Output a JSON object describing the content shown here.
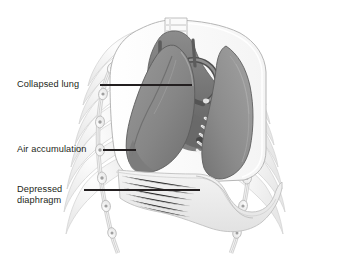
{
  "illustration": {
    "title": "Tension pneumothorax thoracic cavity illustration",
    "style": "grayscale medical line and wash drawing",
    "background_color": "#ffffff",
    "ink_color": "#231f20"
  },
  "labels": [
    {
      "id": "collapsed-lung",
      "text": "Collapsed lung",
      "lines": [
        "Collapsed lung"
      ],
      "text_x": 17,
      "text_y": 79,
      "leader": {
        "x1": 100,
        "y1": 85,
        "x2": 192,
        "y2": 85
      }
    },
    {
      "id": "air-accumulation",
      "text": "Air accumulation",
      "lines": [
        "Air accumulation"
      ],
      "text_x": 17,
      "text_y": 144,
      "leader": {
        "x1": 103,
        "y1": 150,
        "x2": 136,
        "y2": 150
      }
    },
    {
      "id": "depressed-diaphragm",
      "text": "Depressed\ndiaphragm",
      "lines": [
        "Depressed",
        "diaphragm"
      ],
      "text_x": 17,
      "text_y": 184,
      "leader": {
        "x1": 84,
        "y1": 190,
        "x2": 200,
        "y2": 190
      }
    }
  ],
  "anatomy": {
    "parts": [
      {
        "name": "trachea",
        "description": "banded cartilage tube at top center",
        "color": "#f2f2f2"
      },
      {
        "name": "collapsed-left-lung",
        "description": "shrunken dark gray lung on viewer left",
        "color": "#8a8a8a"
      },
      {
        "name": "right-lung",
        "description": "normal lung on viewer right with rib impressions",
        "color": "#8f8f8f"
      },
      {
        "name": "pleural-air-space",
        "description": "clear space between chest wall and collapsed lung",
        "color": "#fbfbfb"
      },
      {
        "name": "depressed-diaphragm",
        "description": "flattened downward-bulging diaphragm sheet",
        "color": "#ececec"
      },
      {
        "name": "mediastinum-heart",
        "description": "central heart and great vessels",
        "color": "#6f6f6f"
      },
      {
        "name": "rib-cage",
        "description": "pale outlined ribs in cross section on both sides",
        "color": "#e8e8e8"
      }
    ]
  },
  "palette": {
    "lung_dark": "#7e7e7e",
    "lung_mid": "#949494",
    "lung_light": "#ababab",
    "mediastinum": "#6c6c6c",
    "diaphragm": "#ededed",
    "rib_fill": "#f0f0f0",
    "rib_stroke": "#c9c9c9",
    "outline": "#8d8d8d",
    "text": "#231f20"
  }
}
